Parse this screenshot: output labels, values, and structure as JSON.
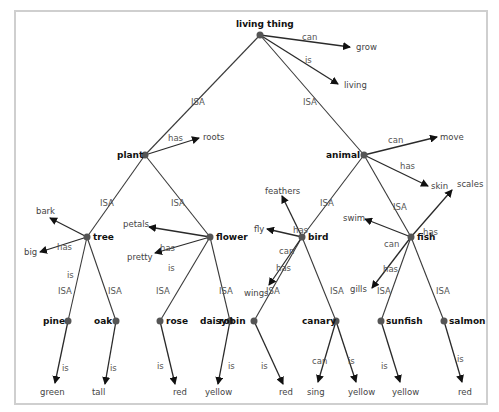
{
  "diagram": {
    "type": "semantic-network",
    "nodes": {
      "living_thing": "living thing",
      "plant": "plant",
      "animal": "animal",
      "tree": "tree",
      "flower": "flower",
      "bird": "bird",
      "fish": "fish",
      "pine": "pine",
      "oak": "oak",
      "rose": "rose",
      "daisy": "daisy",
      "robin": "robin",
      "canary": "canary",
      "sunfish": "sunfish",
      "salmon": "salmon"
    },
    "properties": {
      "grow": "grow",
      "living": "living",
      "roots": "roots",
      "move": "move",
      "skin": "skin",
      "bark": "bark",
      "big": "big",
      "petals": "petals",
      "pretty": "pretty",
      "feathers": "feathers",
      "fly": "fly",
      "wings": "wings",
      "scales": "scales",
      "swim": "swim",
      "gills": "gills",
      "green": "green",
      "tall": "tall",
      "rose_red": "red",
      "daisy_yellow": "yellow",
      "robin_red": "red",
      "sing": "sing",
      "canary_yellow": "yellow",
      "sunfish_yellow": "yellow",
      "salmon_red": "red"
    },
    "relations": {
      "isa": "ISA",
      "can": "can",
      "is": "is",
      "has": "has"
    }
  }
}
